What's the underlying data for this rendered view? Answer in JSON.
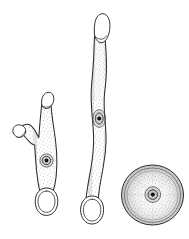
{
  "figure": {
    "title": "",
    "background_color": "#ffffff",
    "ink_color": "#2b2b2b",
    "stipple_color": "#6e6e6e",
    "nucleus_color": "#111111",
    "width": 189,
    "height": 239,
    "style": "stippled ink line drawing, scientific illustration",
    "subjects": [
      {
        "id": "branched-filament",
        "label": "branched filament cell",
        "view": "lateral",
        "position": "left",
        "features": [
          "two apical hyaline caps",
          "short lateral branch",
          "single central nucleus",
          "basal oval holdfast",
          "stippled cytoplasm"
        ],
        "nucleus_count": 1,
        "apical_caps": 2,
        "holdfasts": 1
      },
      {
        "id": "straight-filament",
        "label": "elongate sinuous filament cell",
        "view": "lateral",
        "position": "center",
        "features": [
          "single apical hyaline cap",
          "sinuous elongate body",
          "median swelling",
          "single nucleus with halo",
          "basal oval holdfast",
          "stippled cytoplasm"
        ],
        "nucleus_count": 1,
        "apical_caps": 1,
        "holdfasts": 1
      },
      {
        "id": "circular-cell",
        "label": "circular cell, surface view",
        "view": "apical / top-down",
        "position": "lower right",
        "features": [
          "concentric rim rings",
          "radial stippling",
          "central nucleus with halo"
        ],
        "nucleus_count": 1,
        "ring_count": 3
      }
    ]
  },
  "labels": {
    "figure_number": "",
    "scale_bar": "",
    "caption": ""
  }
}
